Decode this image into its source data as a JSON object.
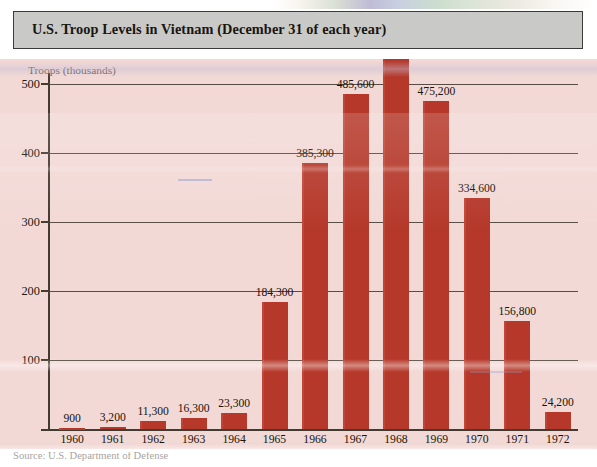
{
  "title": {
    "text": "U.S. Troop Levels in Vietnam (December 31 of each year)"
  },
  "caption": {
    "text": "Source: U.S. Department of Defense"
  },
  "colors": {
    "bar": "#B5382A",
    "panel_background": "#F2D9D6",
    "title_bar": "#C9C9C7",
    "axis": "#433A31",
    "text": "#18130C"
  },
  "axis": {
    "y_title": "Troops (thousands)",
    "y_ticks": [
      "100",
      "200",
      "300",
      "400",
      "500"
    ],
    "x_ticks": [
      "1960",
      "1961",
      "1962",
      "1963",
      "1964",
      "1965",
      "1966",
      "1967",
      "1968",
      "1969",
      "1970",
      "1971",
      "1972"
    ]
  },
  "chart_data": {
    "type": "bar",
    "title": "U.S. Troop Levels in Vietnam (December 31 of each year)",
    "xlabel": "",
    "ylabel": "Troops (thousands)",
    "ylim": [
      0,
      560
    ],
    "grid": true,
    "legend": false,
    "unit": "troops",
    "value_axis_scale": "thousands",
    "categories": [
      "1960",
      "1961",
      "1962",
      "1963",
      "1964",
      "1965",
      "1966",
      "1967",
      "1968",
      "1969",
      "1970",
      "1971",
      "1972"
    ],
    "values": [
      900,
      3200,
      11300,
      16300,
      23300,
      184300,
      385300,
      485600,
      536100,
      475200,
      334600,
      156800,
      24200
    ],
    "values_thousands": [
      0.9,
      3.2,
      11.3,
      16.3,
      23.3,
      184.3,
      385.3,
      485.6,
      536.1,
      475.2,
      334.6,
      156.8,
      24.2
    ],
    "data_labels": [
      "900",
      "3,200",
      "11,300",
      "16,300",
      "23,300",
      "184,300",
      "385,300",
      "485,600",
      "536,100",
      "475,200",
      "334,600",
      "156,800",
      "24,200"
    ]
  },
  "bars": [
    {
      "year": "1960",
      "label": "900",
      "value": 900
    },
    {
      "year": "1961",
      "label": "3,200",
      "value": 3200
    },
    {
      "year": "1962",
      "label": "11,300",
      "value": 11300
    },
    {
      "year": "1963",
      "label": "16,300",
      "value": 16300
    },
    {
      "year": "1964",
      "label": "23,300",
      "value": 23300
    },
    {
      "year": "1965",
      "label": "184,300",
      "value": 184300
    },
    {
      "year": "1966",
      "label": "385,300",
      "value": 385300
    },
    {
      "year": "1967",
      "label": "485,600",
      "value": 485600
    },
    {
      "year": "1968",
      "label": "536,100",
      "value": 536100
    },
    {
      "year": "1969",
      "label": "475,200",
      "value": 475200
    },
    {
      "year": "1970",
      "label": "334,600",
      "value": 334600
    },
    {
      "year": "1971",
      "label": "156,800",
      "value": 156800
    },
    {
      "year": "1972",
      "label": "24,200",
      "value": 24200
    }
  ]
}
